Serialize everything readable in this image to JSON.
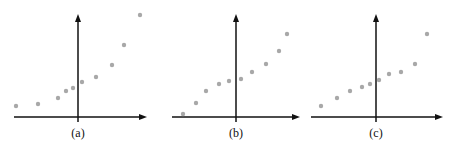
{
  "figure": {
    "panels": [
      {
        "label": "(a)",
        "axis": {
          "origin": [
            78,
            117
          ],
          "x_start": 14,
          "x_end": 147,
          "y_top": 14
        },
        "points": [
          [
            16,
            106
          ],
          [
            38,
            104
          ],
          [
            58,
            98
          ],
          [
            66,
            91
          ],
          [
            73,
            88
          ],
          [
            82,
            82
          ],
          [
            96,
            77
          ],
          [
            112,
            65
          ],
          [
            124,
            45
          ],
          [
            140,
            15
          ]
        ]
      },
      {
        "label": "(b)",
        "axis": {
          "origin": [
            236,
            117
          ],
          "x_start": 172,
          "x_end": 300,
          "y_top": 14
        },
        "points": [
          [
            183,
            114
          ],
          [
            196,
            103
          ],
          [
            206,
            91
          ],
          [
            219,
            84
          ],
          [
            229,
            81
          ],
          [
            241,
            79
          ],
          [
            252,
            72
          ],
          [
            266,
            64
          ],
          [
            279,
            51
          ],
          [
            287,
            34
          ]
        ]
      },
      {
        "label": "(c)",
        "axis": {
          "origin": [
            376,
            117
          ],
          "x_start": 311,
          "x_end": 443,
          "y_top": 14
        },
        "points": [
          [
            321,
            106
          ],
          [
            337,
            98
          ],
          [
            350,
            91
          ],
          [
            362,
            87
          ],
          [
            370,
            84
          ],
          [
            379,
            80
          ],
          [
            389,
            74
          ],
          [
            401,
            72
          ],
          [
            415,
            64
          ],
          [
            427,
            34
          ]
        ]
      }
    ],
    "colors": {
      "axis": "#111111",
      "point": "#a8a8a8"
    }
  }
}
